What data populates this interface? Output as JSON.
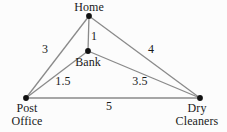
{
  "diagram": {
    "type": "weighted-graph",
    "background_color": "#fcfcfc",
    "edge_color": "#8a8a8a",
    "node_color": "#1a1a1a",
    "text_color": "#1a1a1a",
    "nodes": [
      {
        "id": "home",
        "label": "Home",
        "label_lines": [
          "Home"
        ],
        "x": 89,
        "y": 16,
        "label_position": "above"
      },
      {
        "id": "bank",
        "label": "Bank",
        "label_lines": [
          "Bank"
        ],
        "x": 88,
        "y": 51,
        "label_position": "below"
      },
      {
        "id": "post",
        "label": "Post Office",
        "label_lines": [
          "Post",
          "Office"
        ],
        "x": 26,
        "y": 98,
        "label_position": "below"
      },
      {
        "id": "dry",
        "label": "Dry Cleaners",
        "label_lines": [
          "Dry",
          "Cleaners"
        ],
        "x": 200,
        "y": 98,
        "label_position": "below"
      }
    ],
    "edges": [
      {
        "id": "home-post",
        "from": "home",
        "to": "post",
        "weight": "3",
        "label_x": 45,
        "label_y": 49
      },
      {
        "id": "home-bank",
        "from": "home",
        "to": "bank",
        "weight": "1",
        "label_x": 94,
        "label_y": 36
      },
      {
        "id": "home-dry",
        "from": "home",
        "to": "dry",
        "weight": "4",
        "label_x": 151,
        "label_y": 49
      },
      {
        "id": "bank-post",
        "from": "bank",
        "to": "post",
        "weight": "1.5",
        "label_x": 63,
        "label_y": 81
      },
      {
        "id": "bank-dry",
        "from": "bank",
        "to": "dry",
        "weight": "3.5",
        "label_x": 140,
        "label_y": 81
      },
      {
        "id": "post-dry",
        "from": "post",
        "to": "dry",
        "weight": "5",
        "label_x": 109,
        "label_y": 106
      }
    ]
  },
  "labels": {
    "home": "Home",
    "bank": "Bank",
    "post_line1": "Post",
    "post_line2": "Office",
    "dry_line1": "Dry",
    "dry_line2": "Cleaners",
    "weight_home_post": "3",
    "weight_home_bank": "1",
    "weight_home_dry": "4",
    "weight_bank_post": "1.5",
    "weight_bank_dry": "3.5",
    "weight_post_dry": "5"
  }
}
